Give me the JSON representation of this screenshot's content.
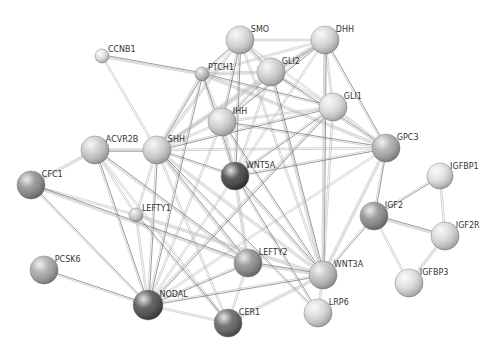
{
  "diagram": {
    "type": "protein-interaction-network",
    "background": "#ffffff",
    "nodes": [
      {
        "id": "CCNB1",
        "label": "CCNB1",
        "x": 102,
        "y": 56,
        "r": 7,
        "shade": "#e2e2e2"
      },
      {
        "id": "PTCH1",
        "label": "PTCH1",
        "x": 202,
        "y": 74,
        "r": 7,
        "shade": "#bdbdbd"
      },
      {
        "id": "SMO",
        "label": "SMO",
        "x": 240,
        "y": 40,
        "r": 14,
        "shade": "#d6d6d6"
      },
      {
        "id": "DHH",
        "label": "DHH",
        "x": 325,
        "y": 40,
        "r": 14,
        "shade": "#d6d6d6"
      },
      {
        "id": "GLI2",
        "label": "GLI2",
        "x": 271,
        "y": 72,
        "r": 14,
        "shade": "#d0d0d0"
      },
      {
        "id": "GLI1",
        "label": "GLI1",
        "x": 333,
        "y": 107,
        "r": 14,
        "shade": "#dcdcdc"
      },
      {
        "id": "IHH",
        "label": "IHH",
        "x": 222,
        "y": 122,
        "r": 14,
        "shade": "#d0d0d0"
      },
      {
        "id": "SHH",
        "label": "SHH",
        "x": 157,
        "y": 150,
        "r": 14,
        "shade": "#d0d0d0"
      },
      {
        "id": "ACVR2B",
        "label": "ACVR2B",
        "x": 95,
        "y": 150,
        "r": 14,
        "shade": "#c8c8c8"
      },
      {
        "id": "GPC3",
        "label": "GPC3",
        "x": 386,
        "y": 148,
        "r": 14,
        "shade": "#a8a8a8"
      },
      {
        "id": "WNT5A",
        "label": "WNT5A",
        "x": 235,
        "y": 176,
        "r": 14,
        "shade": "#3e3e3e"
      },
      {
        "id": "CFC1",
        "label": "CFC1",
        "x": 31,
        "y": 185,
        "r": 14,
        "shade": "#8a8a8a"
      },
      {
        "id": "LEFTY1",
        "label": "LEFTY1",
        "x": 136,
        "y": 215,
        "r": 7,
        "shade": "#cacaca"
      },
      {
        "id": "IGFBP1",
        "label": "IGFBP1",
        "x": 440,
        "y": 176,
        "r": 13,
        "shade": "#e0e0e0"
      },
      {
        "id": "IGF2",
        "label": "IGF2",
        "x": 374,
        "y": 216,
        "r": 14,
        "shade": "#8a8a8a"
      },
      {
        "id": "IGF2R",
        "label": "IGF2R",
        "x": 445,
        "y": 236,
        "r": 14,
        "shade": "#d8d8d8"
      },
      {
        "id": "LEFTY2",
        "label": "LEFTY2",
        "x": 248,
        "y": 263,
        "r": 14,
        "shade": "#8a8a8a"
      },
      {
        "id": "WNT3A",
        "label": "WNT3A",
        "x": 323,
        "y": 275,
        "r": 14,
        "shade": "#bdbdbd"
      },
      {
        "id": "PCSK6",
        "label": "PCSK6",
        "x": 44,
        "y": 270,
        "r": 14,
        "shade": "#a4a4a4"
      },
      {
        "id": "IGFBP3",
        "label": "IGFBP3",
        "x": 409,
        "y": 283,
        "r": 14,
        "shade": "#dedede"
      },
      {
        "id": "NODAL",
        "label": "NODAL",
        "x": 148,
        "y": 305,
        "r": 15,
        "shade": "#4a4a4a"
      },
      {
        "id": "LRP6",
        "label": "LRP6",
        "x": 318,
        "y": 313,
        "r": 14,
        "shade": "#dadada"
      },
      {
        "id": "CER1",
        "label": "CER1",
        "x": 228,
        "y": 323,
        "r": 14,
        "shade": "#5e5e5e"
      }
    ],
    "edges": [
      [
        "CCNB1",
        "PTCH1"
      ],
      [
        "CCNB1",
        "SHH"
      ],
      [
        "PTCH1",
        "SMO"
      ],
      [
        "PTCH1",
        "GLI2"
      ],
      [
        "PTCH1",
        "GLI1"
      ],
      [
        "PTCH1",
        "IHH"
      ],
      [
        "PTCH1",
        "SHH"
      ],
      [
        "PTCH1",
        "DHH"
      ],
      [
        "PTCH1",
        "WNT5A"
      ],
      [
        "PTCH1",
        "GPC3"
      ],
      [
        "PTCH1",
        "NODAL"
      ],
      [
        "SMO",
        "DHH"
      ],
      [
        "SMO",
        "GLI2"
      ],
      [
        "SMO",
        "GLI1"
      ],
      [
        "SMO",
        "IHH"
      ],
      [
        "SMO",
        "SHH"
      ],
      [
        "SMO",
        "WNT5A"
      ],
      [
        "SMO",
        "WNT3A"
      ],
      [
        "DHH",
        "GLI2"
      ],
      [
        "DHH",
        "GLI1"
      ],
      [
        "DHH",
        "IHH"
      ],
      [
        "DHH",
        "SHH"
      ],
      [
        "DHH",
        "GPC3"
      ],
      [
        "DHH",
        "WNT5A"
      ],
      [
        "DHH",
        "WNT3A"
      ],
      [
        "GLI2",
        "GLI1"
      ],
      [
        "GLI2",
        "IHH"
      ],
      [
        "GLI2",
        "SHH"
      ],
      [
        "GLI2",
        "GPC3"
      ],
      [
        "GLI2",
        "WNT5A"
      ],
      [
        "GLI2",
        "WNT3A"
      ],
      [
        "GLI1",
        "IHH"
      ],
      [
        "GLI1",
        "SHH"
      ],
      [
        "GLI1",
        "GPC3"
      ],
      [
        "GLI1",
        "WNT5A"
      ],
      [
        "GLI1",
        "WNT3A"
      ],
      [
        "GLI1",
        "NODAL"
      ],
      [
        "IHH",
        "SHH"
      ],
      [
        "IHH",
        "GPC3"
      ],
      [
        "IHH",
        "WNT5A"
      ],
      [
        "IHH",
        "WNT3A"
      ],
      [
        "IHH",
        "NODAL"
      ],
      [
        "SHH",
        "ACVR2B"
      ],
      [
        "SHH",
        "GPC3"
      ],
      [
        "SHH",
        "WNT5A"
      ],
      [
        "SHH",
        "WNT3A"
      ],
      [
        "SHH",
        "NODAL"
      ],
      [
        "SHH",
        "LEFTY1"
      ],
      [
        "SHH",
        "LEFTY2"
      ],
      [
        "SHH",
        "CER1"
      ],
      [
        "SHH",
        "LRP6"
      ],
      [
        "ACVR2B",
        "CFC1"
      ],
      [
        "ACVR2B",
        "NODAL"
      ],
      [
        "ACVR2B",
        "LEFTY1"
      ],
      [
        "ACVR2B",
        "LEFTY2"
      ],
      [
        "ACVR2B",
        "CER1"
      ],
      [
        "GPC3",
        "WNT5A"
      ],
      [
        "GPC3",
        "WNT3A"
      ],
      [
        "GPC3",
        "IGF2"
      ],
      [
        "GPC3",
        "NODAL"
      ],
      [
        "WNT5A",
        "WNT3A"
      ],
      [
        "WNT5A",
        "NODAL"
      ],
      [
        "WNT5A",
        "LRP6"
      ],
      [
        "WNT5A",
        "LEFTY2"
      ],
      [
        "CFC1",
        "NODAL"
      ],
      [
        "CFC1",
        "LEFTY1"
      ],
      [
        "CFC1",
        "LEFTY2"
      ],
      [
        "LEFTY1",
        "NODAL"
      ],
      [
        "LEFTY1",
        "CER1"
      ],
      [
        "LEFTY1",
        "WNT3A"
      ],
      [
        "IGFBP1",
        "IGF2"
      ],
      [
        "IGFBP1",
        "IGF2R"
      ],
      [
        "IGF2",
        "IGF2R"
      ],
      [
        "IGF2",
        "IGFBP3"
      ],
      [
        "IGF2",
        "WNT3A"
      ],
      [
        "IGF2R",
        "IGFBP3"
      ],
      [
        "LEFTY2",
        "NODAL"
      ],
      [
        "LEFTY2",
        "CER1"
      ],
      [
        "LEFTY2",
        "WNT3A"
      ],
      [
        "WNT3A",
        "LRP6"
      ],
      [
        "WNT3A",
        "NODAL"
      ],
      [
        "WNT3A",
        "CER1"
      ],
      [
        "PCSK6",
        "NODAL"
      ],
      [
        "NODAL",
        "CER1"
      ]
    ]
  }
}
